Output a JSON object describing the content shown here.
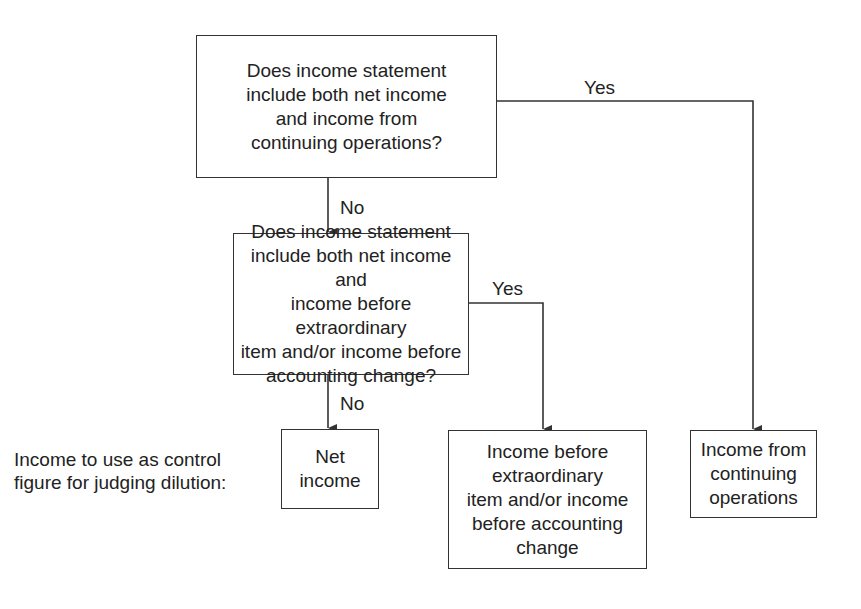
{
  "diagram": {
    "type": "flowchart",
    "nodes": {
      "q1": {
        "text": "Does income statement include both net income and income from continuing operations?",
        "lines": [
          "Does income statement",
          "include both net income",
          "and income from",
          "continuing operations?"
        ]
      },
      "q2": {
        "text": "Does income statement include both net income and income before extraordinary item and/or income before accounting change?",
        "lines": [
          "Does income statement",
          "include both net income and",
          "income before extraordinary",
          "item and/or income before",
          "accounting change?"
        ]
      },
      "r_net": {
        "lines": [
          "Net",
          "income"
        ]
      },
      "r_before": {
        "lines": [
          "Income before",
          "extraordinary",
          "item and/or income",
          "before accounting",
          "change"
        ]
      },
      "r_continuing": {
        "lines": [
          "Income from",
          "continuing",
          "operations"
        ]
      }
    },
    "edges": {
      "q1_yes": "Yes",
      "q1_no": "No",
      "q2_yes": "Yes",
      "q2_no": "No"
    },
    "side_label": {
      "lines": [
        "Income to use as control",
        "figure for judging dilution:"
      ]
    },
    "colors": {
      "line": "#333333",
      "text": "#222222",
      "background": "#ffffff"
    }
  }
}
